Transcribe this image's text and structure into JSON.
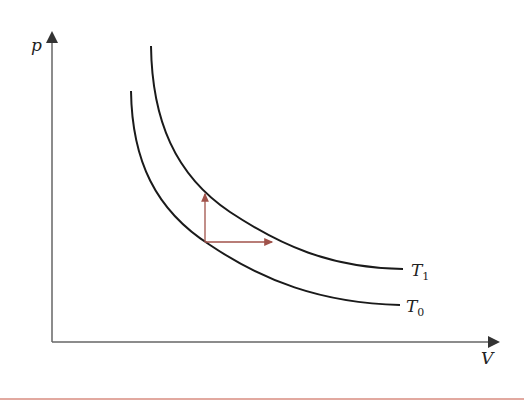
{
  "diagram": {
    "type": "p-V diagram with two isotherms",
    "axes": {
      "y_label": "p",
      "x_label": "V"
    },
    "curves": [
      {
        "name": "T1",
        "label_main": "T",
        "label_sub": "1",
        "description": "higher temperature isotherm"
      },
      {
        "name": "T0",
        "label_main": "T",
        "label_sub": "0",
        "description": "lower temperature isotherm"
      }
    ],
    "arrows": [
      {
        "name": "isochoric-arrow",
        "direction": "up",
        "from": "T0",
        "to": "T1"
      },
      {
        "name": "isobaric-arrow",
        "direction": "right",
        "from": "T0",
        "to": "T1"
      }
    ],
    "colors": {
      "axis": "#555555",
      "curve": "#1a1a1a",
      "arrow": "#a0524a"
    }
  }
}
